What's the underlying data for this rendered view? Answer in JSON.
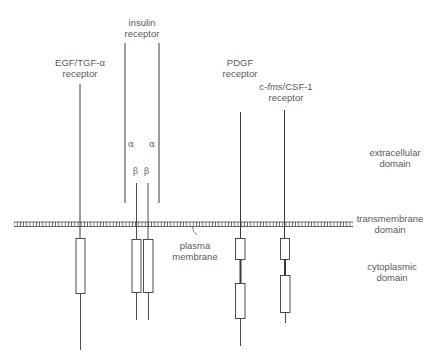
{
  "receptors": {
    "egf": {
      "line1": "EGF/TGF-α",
      "line2": "receptor"
    },
    "insulin": {
      "line1": "insulin",
      "line2": "receptor",
      "alpha": "α",
      "beta": "β"
    },
    "pdgf": {
      "line1": "PDGF",
      "line2": "receptor"
    },
    "cfms": {
      "prefix": "c-",
      "italic": "fms",
      "suffix": "/CSF-1",
      "line2": "receptor"
    }
  },
  "domains": {
    "extracellular": {
      "line1": "extracellular",
      "line2": "domain"
    },
    "transmembrane": {
      "line1": "transmembrane",
      "line2": "domain"
    },
    "cytoplasmic": {
      "line1": "cytoplasmic",
      "line2": "domain"
    }
  },
  "membrane": {
    "line1": "plasma",
    "line2": "membrane"
  },
  "colors": {
    "line": "#3a3a3a",
    "text": "#5a5a5a",
    "background": "#ffffff"
  }
}
